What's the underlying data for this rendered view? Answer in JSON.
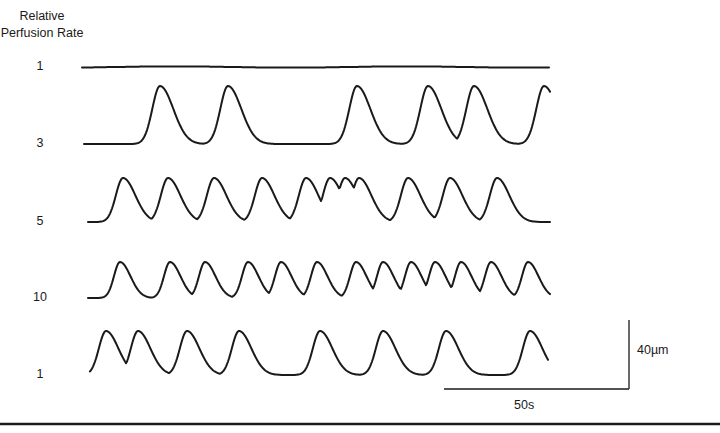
{
  "chart_data": {
    "type": "line",
    "title": "",
    "ylabel": "Relative Perfusion Rate",
    "xlabel": "",
    "grid": false,
    "legend": null,
    "scale_bars": {
      "vertical": "40µm",
      "horizontal": "50s"
    },
    "series": [
      {
        "name": "1",
        "description": "flat, no oscillation",
        "y_pixel": 67,
        "peaks_x": []
      },
      {
        "name": "3",
        "description": "sparse large oscillations",
        "y_pixel": 144,
        "peaks_x": [
          160,
          228,
          357,
          428,
          474,
          544
        ]
      },
      {
        "name": "5",
        "description": "regular oscillations with burst mid-trace",
        "y_pixel": 222,
        "peaks_x": [
          123,
          168,
          214,
          262,
          306,
          330,
          345,
          359,
          408,
          450,
          497
        ]
      },
      {
        "name": "10",
        "description": "frequent oscillations",
        "y_pixel": 298,
        "peaks_x": [
          120,
          170,
          205,
          248,
          281,
          317,
          356,
          383,
          411,
          435,
          461,
          491,
          528
        ]
      },
      {
        "name": "1",
        "description": "return to baseline rate, larger sparse oscillations",
        "y_pixel": 375,
        "peaks_x": [
          106,
          138,
          187,
          239,
          320,
          383,
          446,
          530
        ]
      }
    ]
  },
  "figure": {
    "ylabel_line1": "Relative",
    "ylabel_line2": "Perfusion Rate",
    "rates": [
      "1",
      "3",
      "5",
      "10",
      "1"
    ],
    "scale_vertical": "40µm",
    "scale_horizontal": "50s"
  }
}
